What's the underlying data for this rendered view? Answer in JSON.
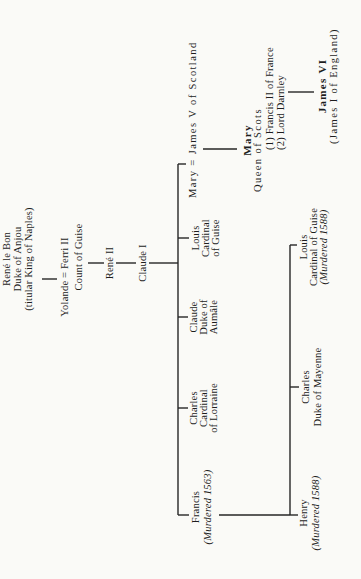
{
  "ink_color": "#262626",
  "paper_color": "#fafaf7",
  "diagram_type": "family-tree",
  "nodes": {
    "rene_le_bon": {
      "lines": [
        "René le Bon",
        "Duke of Anjou",
        "(titular King of Naples)"
      ]
    },
    "yolande": {
      "lines": [
        "Yolande = Ferri II",
        "Count of Guise"
      ]
    },
    "rene_ii": {
      "lines": [
        "René II"
      ]
    },
    "claude_i": {
      "lines": [
        "Claude I"
      ]
    },
    "francis": {
      "lines": [
        "Francis",
        "(Murdered 1563)"
      ]
    },
    "charles_lorraine": {
      "lines": [
        "Charles",
        "Cardinal",
        "of Lorraine"
      ]
    },
    "claude_aumale": {
      "lines": [
        "Claude",
        "Duke of",
        "Aumâle"
      ]
    },
    "louis_cardinal_guise": {
      "lines": [
        "Louis",
        "Cardinal",
        "of Guise"
      ]
    },
    "mary_james_v": {
      "lines": [
        "Mary = James V of Scotland"
      ]
    },
    "henry": {
      "lines": [
        "Henry",
        "(Murdered 1588)"
      ]
    },
    "charles_mayenne": {
      "lines": [
        "Charles",
        "Duke of Mayenne"
      ]
    },
    "louis_guise_murdered": {
      "lines": [
        "Louis",
        "Cardinal of Guise",
        "(Murdered 1588)"
      ]
    },
    "mary_queen_of_scots": {
      "lines": [
        "Mary",
        "Queen of Scots",
        "(1) Francis II of France",
        "(2) Lord Darnley"
      ]
    },
    "james_vi": {
      "lines": [
        "James VI",
        "(James I of England)"
      ]
    }
  },
  "edges": [
    {
      "from": "rene_le_bon",
      "to": "yolande"
    },
    {
      "from": "yolande",
      "to": "rene_ii"
    },
    {
      "from": "rene_ii",
      "to": "claude_i"
    },
    {
      "from": "claude_i",
      "to": "francis"
    },
    {
      "from": "claude_i",
      "to": "charles_lorraine"
    },
    {
      "from": "claude_i",
      "to": "claude_aumale"
    },
    {
      "from": "claude_i",
      "to": "louis_cardinal_guise"
    },
    {
      "from": "claude_i",
      "to": "mary_james_v"
    },
    {
      "from": "francis",
      "to": "henry"
    },
    {
      "from": "francis",
      "to": "charles_mayenne"
    },
    {
      "from": "francis",
      "to": "louis_guise_murdered"
    },
    {
      "from": "mary_james_v",
      "to": "mary_queen_of_scots"
    },
    {
      "from": "mary_queen_of_scots",
      "to": "james_vi"
    }
  ]
}
